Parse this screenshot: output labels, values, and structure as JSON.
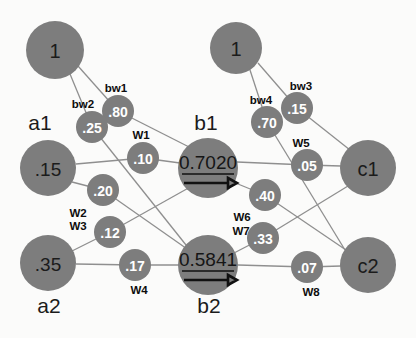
{
  "diagram": {
    "background_color": "#fbfbfa",
    "node_color": "#7d7d7d",
    "edge_color": "#8f8f8f",
    "small_node_text_color": "#ffffff",
    "label_text_color": "#1b1b1b"
  },
  "nodes": {
    "bias_left": {
      "label": "1",
      "cx": 55,
      "cy": 50,
      "r": 29
    },
    "bias_right": {
      "label": "1",
      "cx": 236,
      "cy": 48,
      "r": 26
    },
    "a1": {
      "label": ".15",
      "cx": 48,
      "cy": 168,
      "r": 28
    },
    "a2": {
      "label": ".35",
      "cx": 48,
      "cy": 263,
      "r": 28
    },
    "b1": {
      "label": "0.7020",
      "cx": 208,
      "cy": 168,
      "r": 30
    },
    "b2": {
      "label": "0.5841",
      "cx": 208,
      "cy": 265,
      "r": 30
    },
    "c1": {
      "label": "c1",
      "cx": 368,
      "cy": 168,
      "r": 28
    },
    "c2": {
      "label": "c2",
      "cx": 368,
      "cy": 265,
      "r": 28
    }
  },
  "weights": [
    {
      "name": "bw1",
      "value": ".80",
      "cx": 118,
      "cy": 111,
      "r": 16,
      "label_x": 116,
      "label_y": 88
    },
    {
      "name": "bw2",
      "value": ".25",
      "cx": 92,
      "cy": 127,
      "r": 16,
      "label_x": 83,
      "label_y": 104
    },
    {
      "name": "W1",
      "value": ".10",
      "cx": 143,
      "cy": 158,
      "r": 16,
      "label_x": 141,
      "label_y": 135
    },
    {
      "name": "W2",
      "value": ".20",
      "cx": 103,
      "cy": 190,
      "r": 16,
      "label_x": 78,
      "label_y": 213
    },
    {
      "name": "W3",
      "value": ".12",
      "cx": 110,
      "cy": 232,
      "r": 16,
      "label_x": 78,
      "label_y": 226
    },
    {
      "name": "W4",
      "value": ".17",
      "cx": 135,
      "cy": 265,
      "r": 16,
      "label_x": 139,
      "label_y": 290
    },
    {
      "name": "bw3",
      "value": ".15",
      "cx": 297,
      "cy": 108,
      "r": 16,
      "label_x": 301,
      "label_y": 86
    },
    {
      "name": "bw4",
      "value": ".70",
      "cx": 267,
      "cy": 122,
      "r": 16,
      "label_x": 261,
      "label_y": 100
    },
    {
      "name": "W5",
      "value": ".05",
      "cx": 307,
      "cy": 165,
      "r": 16,
      "label_x": 301,
      "label_y": 143
    },
    {
      "name": "W6",
      "value": ".40",
      "cx": 265,
      "cy": 195,
      "r": 16,
      "label_x": 242,
      "label_y": 217
    },
    {
      "name": "W7",
      "value": ".33",
      "cx": 263,
      "cy": 238,
      "r": 16,
      "label_x": 241,
      "label_y": 231
    },
    {
      "name": "W8",
      "value": ".07",
      "cx": 307,
      "cy": 267,
      "r": 16,
      "label_x": 311,
      "label_y": 292
    }
  ],
  "layer_labels": [
    {
      "text": "a1",
      "x": 40,
      "y": 122
    },
    {
      "text": "a2",
      "x": 49,
      "y": 305
    },
    {
      "text": "b1",
      "x": 206,
      "y": 122
    },
    {
      "text": "b2",
      "x": 209,
      "y": 305
    }
  ],
  "outputs": {
    "b1_value": "0.7020",
    "b2_value": "0.5841"
  }
}
